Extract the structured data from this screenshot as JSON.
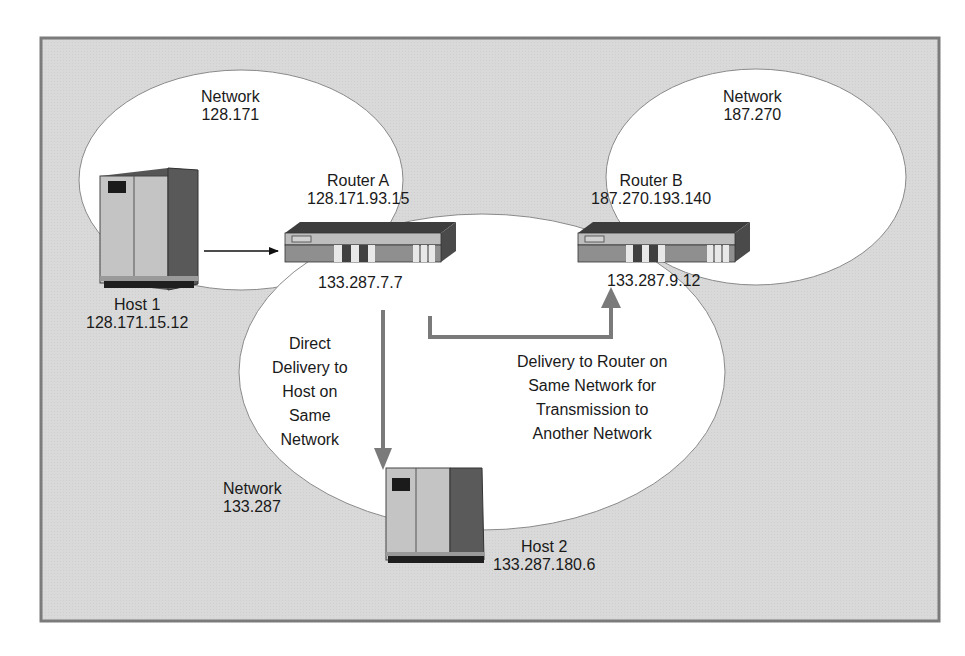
{
  "networks": [
    {
      "id": "net-128-171",
      "label": "Network",
      "address": "128.171"
    },
    {
      "id": "net-187-270",
      "label": "Network",
      "address": "187.270"
    },
    {
      "id": "net-133-287",
      "label": "Network",
      "address": "133.287"
    }
  ],
  "routers": [
    {
      "id": "router-a",
      "name": "Router A",
      "upper_ip": "128.171.93.15",
      "lower_ip": "133.287.7.7"
    },
    {
      "id": "router-b",
      "name": "Router B",
      "upper_ip": "187.270.193.140",
      "lower_ip": "133.287.9.12"
    }
  ],
  "hosts": [
    {
      "id": "host-1",
      "name": "Host 1",
      "ip": "128.171.15.12"
    },
    {
      "id": "host-2",
      "name": "Host 2",
      "ip": "133.287.180.6"
    }
  ],
  "annotations": {
    "direct": [
      "Direct",
      "Delivery to",
      "Host on",
      "Same",
      "Network"
    ],
    "router_delivery": [
      "Delivery to Router on",
      "Same Network for",
      "Transmission to",
      "Another Network"
    ]
  },
  "colors": {
    "frame_fill": "#d9d9d9",
    "frame_border": "#7b7b7b",
    "ellipse_fill": "#ffffff",
    "arrow_gray": "#7a7a7a",
    "text": "#1a1a1a"
  }
}
